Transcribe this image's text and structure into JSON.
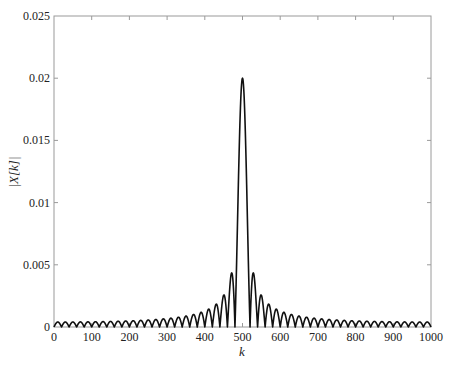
{
  "chart_data": {
    "type": "line",
    "title": "",
    "xlabel": "k",
    "ylabel": "|X[k]|",
    "xlim": [
      0,
      1000
    ],
    "ylim": [
      0,
      0.025
    ],
    "grid": false,
    "legend": null,
    "x_ticks": [
      0,
      100,
      200,
      300,
      400,
      500,
      600,
      700,
      800,
      900,
      1000
    ],
    "x_tick_labels": [
      "0",
      "100",
      "200",
      "300",
      "400",
      "500",
      "600",
      "700",
      "800",
      "900",
      "1000"
    ],
    "y_ticks": [
      0,
      0.005,
      0.01,
      0.015,
      0.02,
      0.025
    ],
    "y_tick_labels": [
      "0",
      "0.005",
      "0.01",
      "0.015",
      "0.02",
      "0.025"
    ],
    "series": [
      {
        "name": "|X[k]|",
        "description": "Magnitude of a Dirichlet (periodic sinc) kernel centered at k=500, nulls every 20 samples",
        "model": {
          "center": 500,
          "N": 1000,
          "L": 50,
          "peak": 0.02
        },
        "key_points": [
          {
            "k": 0,
            "value": 0
          },
          {
            "k": 10,
            "value": 0.0007
          },
          {
            "k": 450,
            "value": 0.0028
          },
          {
            "k": 470,
            "value": 0.0046
          },
          {
            "k": 480,
            "value": 0
          },
          {
            "k": 500,
            "value": 0.02
          },
          {
            "k": 520,
            "value": 0
          },
          {
            "k": 530,
            "value": 0.0046
          },
          {
            "k": 550,
            "value": 0.0028
          },
          {
            "k": 990,
            "value": 0.0007
          },
          {
            "k": 1000,
            "value": 0
          }
        ]
      }
    ]
  },
  "plot_area": {
    "left": 54,
    "right": 431,
    "top": 16,
    "bottom": 327
  },
  "axes": {
    "xlabel": "k",
    "ylabel": "|X[k]|"
  }
}
